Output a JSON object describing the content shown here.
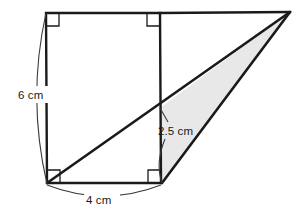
{
  "figure": {
    "canvas": {
      "width": 306,
      "height": 217,
      "background": "#ffffff"
    },
    "colors": {
      "stroke": "#1a1a1a",
      "thin_stroke": "#3a3a3a",
      "shade_fill": "#e8e8e8",
      "rect_fill": "#ffffff",
      "label_text": "#1a1a1a"
    },
    "labels": {
      "height_label": "6 cm",
      "base_label": "4 cm",
      "triangle_height_label": "2.5 cm"
    },
    "vertices": {
      "rect_top_left": [
        46,
        13
      ],
      "rect_top_right": [
        160,
        13
      ],
      "rect_bottom_right": [
        161,
        183
      ],
      "rect_bottom_left": [
        47,
        183
      ],
      "apex_right": [
        290,
        12
      ],
      "diagonal_intersection": [
        160,
        108
      ]
    },
    "right_angles": [
      {
        "name": "top-left",
        "x": 46,
        "y": 13
      },
      {
        "name": "top-middle",
        "x": 160,
        "y": 13
      },
      {
        "name": "bottom-left",
        "x": 47,
        "y": 183
      },
      {
        "name": "bottom-middle",
        "x": 161,
        "y": 183
      }
    ],
    "measurements": {
      "rectangle_height_cm": 6,
      "rectangle_width_cm": 4,
      "triangle_height_cm": 2.5
    }
  }
}
